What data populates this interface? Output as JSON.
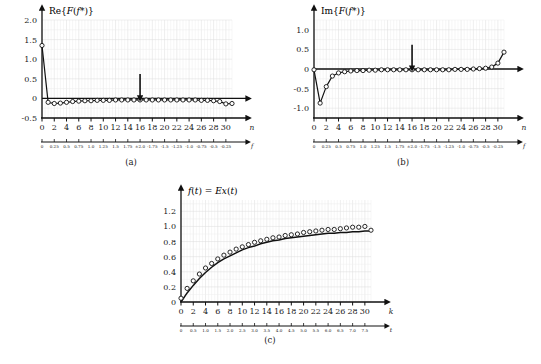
{
  "figure": {
    "background": "#ffffff",
    "grid_color": "#dcdcdc",
    "grid_minor_color": "#ececec",
    "axis_color": "#111111",
    "curve_color": "#111111",
    "marker_face": "#ffffff"
  },
  "panels": [
    {
      "id": "a",
      "caption": "(a)",
      "ylabel": "Re{F(f*)}",
      "xlabel_primary": "n",
      "xlabel_secondary": "f"
    },
    {
      "id": "b",
      "caption": "(b)",
      "ylabel": "Im{F(f*)}",
      "xlabel_primary": "n",
      "xlabel_secondary": "f"
    },
    {
      "id": "c",
      "caption": "(c)",
      "ylabel": "f(t) = Ex(t)",
      "xlabel_primary": "k",
      "xlabel_secondary": "t"
    }
  ],
  "chart_data": [
    {
      "type": "line",
      "id": "a",
      "title": "Re{F(f*)}",
      "xlabel": "n",
      "xlabel_secondary": "f",
      "ylabel": "Re{F(f*)}",
      "grid": true,
      "markers": "open-circle",
      "xlim": [
        0,
        31
      ],
      "ylim": [
        -0.5,
        2.0
      ],
      "yticks": [
        -0.5,
        0,
        0.5,
        1.0,
        1.5,
        2.0
      ],
      "ytick_labels": [
        "-0.5",
        "0",
        "0.5",
        "1.0",
        "1.5",
        "2.0"
      ],
      "xticks": [
        0,
        2,
        4,
        6,
        8,
        10,
        12,
        14,
        16,
        18,
        20,
        22,
        24,
        26,
        28,
        30
      ],
      "xtick_labels": [
        "0",
        "2",
        "4",
        "6",
        "8",
        "10",
        "12",
        "14",
        "16",
        "18",
        "20",
        "22",
        "24",
        "26",
        "28",
        "30"
      ],
      "xticks_secondary": [
        0,
        0.25,
        0.5,
        0.75,
        1.0,
        1.25,
        1.5,
        1.75,
        2.0,
        2.25,
        2.5,
        2.75,
        3.0,
        3.25,
        3.5,
        3.75
      ],
      "xtick_labels_secondary": [
        "0",
        "0.25",
        "0.5",
        "0.75",
        "1.0",
        "1.25",
        "1.5",
        "1.75",
        "±2.0",
        "-1.75",
        "-1.5",
        "-1.25",
        "-1.0",
        "-0.75",
        "-0.5",
        "-0.25"
      ],
      "x": [
        0,
        1,
        2,
        3,
        4,
        5,
        6,
        7,
        8,
        9,
        10,
        11,
        12,
        13,
        14,
        15,
        16,
        17,
        18,
        19,
        20,
        21,
        22,
        23,
        24,
        25,
        26,
        27,
        28,
        29,
        30,
        31
      ],
      "values": [
        1.35,
        -0.1,
        -0.13,
        -0.12,
        -0.1,
        -0.08,
        -0.07,
        -0.06,
        -0.06,
        -0.05,
        -0.05,
        -0.05,
        -0.04,
        -0.04,
        -0.04,
        -0.04,
        -0.04,
        -0.04,
        -0.04,
        -0.04,
        -0.04,
        -0.04,
        -0.04,
        -0.04,
        -0.04,
        -0.04,
        -0.05,
        -0.05,
        -0.06,
        -0.08,
        -0.14,
        -0.13
      ],
      "annotation": {
        "type": "arrow-down",
        "x": 16,
        "y_top": 0.62,
        "y_bottom": 0.06
      }
    },
    {
      "type": "line",
      "id": "b",
      "title": "Im{F(f*)}",
      "xlabel": "n",
      "xlabel_secondary": "f",
      "ylabel": "Im{F(f*)}",
      "grid": true,
      "markers": "open-circle",
      "xlim": [
        0,
        31
      ],
      "ylim": [
        -1.25,
        1.25
      ],
      "yticks": [
        -1.0,
        -0.5,
        0,
        0.5,
        1.0
      ],
      "ytick_labels": [
        "-1.0",
        "-0.5",
        "0",
        "0.5",
        "1.0"
      ],
      "xticks": [
        0,
        2,
        4,
        6,
        8,
        10,
        12,
        14,
        16,
        18,
        20,
        22,
        24,
        26,
        28,
        30
      ],
      "xtick_labels": [
        "0",
        "2",
        "4",
        "6",
        "8",
        "10",
        "12",
        "14",
        "16",
        "18",
        "20",
        "22",
        "24",
        "26",
        "28",
        "30"
      ],
      "xticks_secondary": [
        0,
        0.25,
        0.5,
        0.75,
        1.0,
        1.25,
        1.5,
        1.75,
        2.0,
        2.25,
        2.5,
        2.75,
        3.0,
        3.25,
        3.5,
        3.75
      ],
      "xtick_labels_secondary": [
        "0",
        "0.25",
        "0.5",
        "0.75",
        "1.0",
        "1.25",
        "1.5",
        "1.75",
        "±2.0",
        "-1.75",
        "-1.5",
        "-1.25",
        "-1.0",
        "-0.75",
        "-0.5",
        "-0.25"
      ],
      "x": [
        0,
        1,
        2,
        3,
        4,
        5,
        6,
        7,
        8,
        9,
        10,
        11,
        12,
        13,
        14,
        15,
        16,
        17,
        18,
        19,
        20,
        21,
        22,
        23,
        24,
        25,
        26,
        27,
        28,
        29,
        30,
        31
      ],
      "values": [
        -0.02,
        -0.87,
        -0.45,
        -0.18,
        -0.1,
        -0.07,
        -0.05,
        -0.04,
        -0.04,
        -0.03,
        -0.03,
        -0.02,
        -0.02,
        -0.02,
        -0.02,
        -0.02,
        -0.02,
        -0.02,
        -0.02,
        -0.02,
        -0.02,
        -0.02,
        -0.02,
        -0.01,
        -0.01,
        -0.01,
        0.0,
        0.01,
        0.02,
        0.05,
        0.15,
        0.43
      ],
      "annotation": {
        "type": "arrow-down",
        "x": 16,
        "y_top": 0.62,
        "y_bottom": 0.07
      }
    },
    {
      "type": "scatter-line",
      "id": "c",
      "title": "f(t) = Ex(t)",
      "xlabel": "k",
      "xlabel_secondary": "t",
      "ylabel": "f(t) = Ex(t)",
      "grid": true,
      "markers": "open-circle",
      "xlim": [
        0,
        31
      ],
      "ylim": [
        0,
        1.35
      ],
      "yticks": [
        0,
        0.2,
        0.4,
        0.6,
        0.8,
        1.0,
        1.2
      ],
      "ytick_labels": [
        "0",
        "0.2",
        "0.4",
        "0.6",
        "0.8",
        "1.0",
        "1.2"
      ],
      "xticks": [
        0,
        2,
        4,
        6,
        8,
        10,
        12,
        14,
        16,
        18,
        20,
        22,
        24,
        26,
        28,
        30
      ],
      "xtick_labels": [
        "0",
        "2",
        "4",
        "6",
        "8",
        "10",
        "12",
        "14",
        "16",
        "18",
        "20",
        "22",
        "24",
        "26",
        "28",
        "30"
      ],
      "xticks_secondary": [
        0,
        2,
        4,
        6,
        8,
        10,
        12,
        14,
        16,
        18,
        20,
        22,
        24,
        26,
        28,
        30
      ],
      "xtick_labels_secondary": [
        "0",
        "0.5",
        "1.0",
        "1.5",
        "2.0",
        "2.5",
        "3.0",
        "3.5",
        "4.0",
        "4.5",
        "5.0",
        "5.5",
        "6.0",
        "6.5",
        "7.0",
        "7.5"
      ],
      "x": [
        0,
        1,
        2,
        3,
        4,
        5,
        6,
        7,
        8,
        9,
        10,
        11,
        12,
        13,
        14,
        15,
        16,
        17,
        18,
        19,
        20,
        21,
        22,
        23,
        24,
        25,
        26,
        27,
        28,
        29,
        30,
        31
      ],
      "values": [
        0.05,
        0.18,
        0.28,
        0.37,
        0.45,
        0.51,
        0.57,
        0.62,
        0.66,
        0.7,
        0.73,
        0.76,
        0.79,
        0.81,
        0.83,
        0.85,
        0.86,
        0.88,
        0.89,
        0.9,
        0.92,
        0.93,
        0.94,
        0.95,
        0.96,
        0.96,
        0.97,
        0.98,
        0.99,
        0.99,
        1.0,
        0.95
      ],
      "series": [
        {
          "name": "continuous",
          "x": [
            0,
            1,
            2,
            3,
            4,
            5,
            6,
            7,
            8,
            9,
            10,
            11,
            12,
            13,
            14,
            15,
            16,
            17,
            18,
            19,
            20,
            21,
            22,
            23,
            24,
            25,
            26,
            27,
            28,
            29,
            30,
            31
          ],
          "values": [
            0.0,
            0.12,
            0.22,
            0.31,
            0.39,
            0.46,
            0.52,
            0.57,
            0.61,
            0.65,
            0.69,
            0.72,
            0.74,
            0.77,
            0.79,
            0.81,
            0.82,
            0.84,
            0.85,
            0.86,
            0.87,
            0.88,
            0.89,
            0.9,
            0.91,
            0.91,
            0.92,
            0.92,
            0.93,
            0.93,
            0.94,
            0.94
          ]
        }
      ]
    }
  ]
}
